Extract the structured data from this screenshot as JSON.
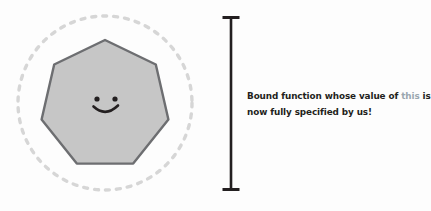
{
  "figure": {
    "name": "bound-function-illustration",
    "background_color": "#fdfdfd",
    "dashed_circle": {
      "label": "dashed-boundary-circle",
      "center_x": 105,
      "center_y": 103,
      "radius": 87,
      "stroke_color": "#d6d6d6",
      "stroke_width": 3.4,
      "dash_pattern": "4 7"
    },
    "polygon": {
      "label": "heptagon-blob",
      "sides": 7,
      "center_x": 105,
      "center_y": 105,
      "radius": 65,
      "fill_color": "#c6c6c6",
      "stroke_color": "#6d6e71",
      "stroke_width": 2.4
    },
    "face": {
      "label": "smiley-face",
      "color": "#231f20",
      "eye_left_x": 97,
      "eye_right_x": 115,
      "eye_y": 99,
      "eye_radius": 2.6,
      "mouth_color": "#231f20"
    }
  },
  "bracket": {
    "name": "vertical-range-bracket",
    "color": "#231f20",
    "x": 231,
    "top_y": 16,
    "bottom_y": 191,
    "cap_width": 17,
    "stem_width": 2.6
  },
  "caption": {
    "name": "bound-function-caption",
    "line1_pre": "Bound function whose value of ",
    "line1_keyword": "this",
    "line1_post": " is",
    "line2": "now fully specified by us!",
    "text_color": "#231f20",
    "keyword_color": "#9aa7b0"
  }
}
